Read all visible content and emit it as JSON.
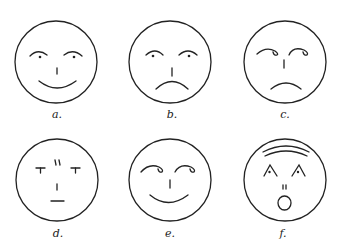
{
  "figure": {
    "faces": [
      {
        "id": "a",
        "label": "a.",
        "expression": "happy",
        "eyes": "arched brows with dots",
        "mouth": "smile"
      },
      {
        "id": "b",
        "label": "b.",
        "expression": "sad",
        "eyes": "arched brows with dots",
        "mouth": "frown"
      },
      {
        "id": "c",
        "label": "c.",
        "expression": "sad, eyes rolled",
        "eyes": "curled brows",
        "mouth": "frown"
      },
      {
        "id": "d",
        "label": "d.",
        "expression": "neutral",
        "eyes": "T-shaped",
        "mouth": "flat line"
      },
      {
        "id": "e",
        "label": "e.",
        "expression": "happy, eyes rolled",
        "eyes": "curled brows",
        "mouth": "smile"
      },
      {
        "id": "f",
        "label": "f.",
        "expression": "surprised",
        "eyes": "caret shapes with dots",
        "mouth": "open O"
      }
    ],
    "colors": {
      "line": "#222222",
      "background": "#ffffff"
    }
  }
}
